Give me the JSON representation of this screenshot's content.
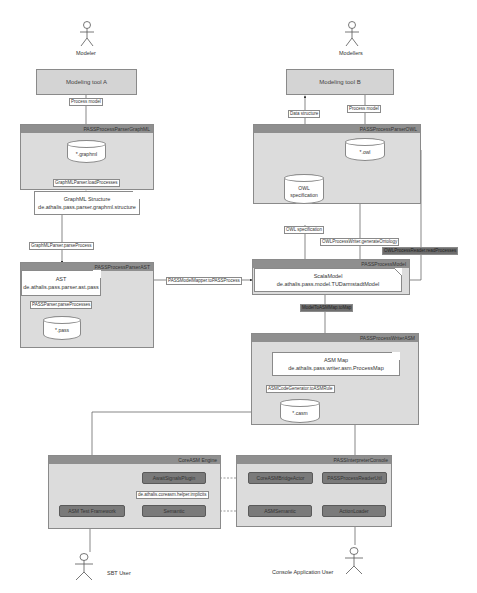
{
  "actors": {
    "modeler_a": "Modeler",
    "modeler_b": "Modellers",
    "sbt_user": "SBT User",
    "console_user": "Console Application User"
  },
  "tools": {
    "tool_a": "Modeling tool A",
    "tool_b": "Modeling tool B"
  },
  "packages": {
    "graphml": "PASSProcessParserGraphML",
    "owl": "PASSProcessParserOWL",
    "ast": "PASSProcessParserAST",
    "model": "PASSProcessModel",
    "writer_asm": "PASSProcessWriterASM",
    "coreasm": "CoreASM Engine",
    "console": "PASSInterpreterConsole"
  },
  "stores": {
    "graphml": "*.graphml",
    "owl": "*.owl",
    "owl_spec_line1": "OWL",
    "owl_spec_line2": "specification",
    "pass": "*.pass",
    "casm": "*.casm"
  },
  "notes": {
    "graphml_title": "GraphML Structure",
    "graphml_class": "de.athalis.pass.parser.graphml.structure",
    "ast_title": "AST",
    "ast_class": "de.athalis.pass.parser.ast.pass",
    "scala_title": "ScalaModel",
    "scala_class": "de.athalis.pass.model.TUDarmstadtModel",
    "asm_title": "ASM Map",
    "asm_class": "de.athalis.pass.writer.asm.ProcessMap"
  },
  "edge_labels": {
    "process_model_a": "Process model",
    "data_structure": "Data structure",
    "process_model_b": "Process model",
    "load_processes": "GraphMLParser.loadProcesses",
    "parse_process": "GraphMLParser.parseProcess",
    "owl_specification": "OWL specification",
    "generate_ontology": "OWLProcessWriter.generateOntology",
    "read_processes": "OWLProcessReader.readProcesses",
    "model_mapper": "PASSModelMapper.toPASSProcess",
    "parse_processes": "PASSParser.parseProcesses",
    "to_map": "ModelToASMMap.toMap",
    "to_asm_rule": "ASMCodeGenerator.toASMRule",
    "implicits": "de.athalis.coreasm.helper.implicits"
  },
  "components": {
    "asm_test_framework": "ASM Test Framework",
    "await_signals_plugin": "AwaitSignalsPlugin",
    "semantic": "Semantic",
    "core_asm_bridge": "CoreASMBridgeActor",
    "pass_process_reader": "PASSProcessReaderUtil",
    "asm_semantic": "ASMSemantic",
    "action_loader": "ActionLoader"
  }
}
